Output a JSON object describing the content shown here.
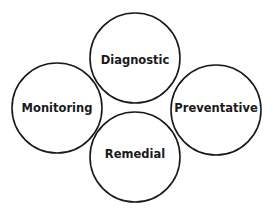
{
  "diagram": {
    "type": "circle-cluster",
    "nodes": [
      {
        "id": "diagnostic",
        "label": "Diagnostic",
        "position": "top"
      },
      {
        "id": "monitoring",
        "label": "Monitoring",
        "position": "left"
      },
      {
        "id": "preventative",
        "label": "Preventative",
        "position": "right"
      },
      {
        "id": "remedial",
        "label": "Remedial",
        "position": "bottom"
      }
    ],
    "colors": {
      "stroke": "#1a1a1a",
      "fill": "#ffffff",
      "text": "#1a1a1a"
    }
  }
}
